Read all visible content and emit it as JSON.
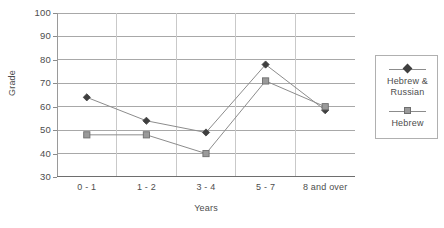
{
  "chart_data": {
    "type": "line",
    "title": "",
    "xlabel": "Years",
    "ylabel": "Grade",
    "categories": [
      "0 - 1",
      "1 - 2",
      "3 - 4",
      "5 - 7",
      "8 and over"
    ],
    "series": [
      {
        "name": "Hebrew & Russian",
        "marker": "diamond",
        "color": "#3f3f3f",
        "values": [
          64,
          54,
          49,
          78,
          58.5
        ]
      },
      {
        "name": "Hebrew",
        "marker": "square",
        "color": "#9a9a9a",
        "values": [
          48,
          48,
          40,
          71,
          60
        ]
      }
    ],
    "ylim": [
      30,
      100
    ],
    "yticks": [
      30,
      40,
      50,
      60,
      70,
      80,
      90,
      100
    ],
    "ytick_labels": [
      "30",
      "40",
      "50",
      "60",
      "70",
      "80",
      "90",
      "100"
    ],
    "grid": "horizontal",
    "legend_position": "right",
    "line_color": "#8c8c8c",
    "axis_color": "#9a9a9a",
    "grid_color": "#a8a8a8"
  },
  "legend": {
    "entries": [
      {
        "label_line1": "Hebrew &",
        "label_line2": "Russian"
      },
      {
        "label_line1": "Hebrew",
        "label_line2": ""
      }
    ]
  }
}
